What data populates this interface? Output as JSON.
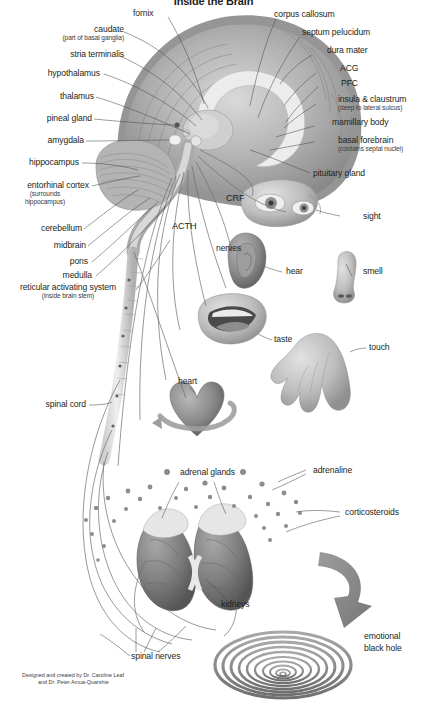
{
  "title": "Inside the Brain",
  "credit": {
    "line1": "Designed and created by Dr. Caroline Leaf",
    "line2": "and Dr. Peter Amua-Quarshie"
  },
  "colors": {
    "background": "#ffffff",
    "text": "#231f20",
    "leader_line": "#4b4b4b",
    "anatomy_mid": "#9a9a9a",
    "anatomy_dark": "#5e5e5e",
    "anatomy_light": "#d4d4d4",
    "arrow": "#8c8c8c",
    "spiral": "#8f8f8f",
    "kidney": "#7d7d7d",
    "heart": "#6f6f6f"
  },
  "brain_labels_left": [
    {
      "id": "fornix",
      "label": "fornix",
      "sub": ""
    },
    {
      "id": "caudate",
      "label": "caudate",
      "sub": "(part of basal ganglia)"
    },
    {
      "id": "stria-terminalis",
      "label": "stria terminalis",
      "sub": ""
    },
    {
      "id": "hypothalamus",
      "label": "hypothalamus",
      "sub": ""
    },
    {
      "id": "thalamus",
      "label": "thalamus",
      "sub": ""
    },
    {
      "id": "pineal-gland",
      "label": "pineal gland",
      "sub": ""
    },
    {
      "id": "amygdala",
      "label": "amygdala",
      "sub": ""
    },
    {
      "id": "hippocampus",
      "label": "hippocampus",
      "sub": ""
    },
    {
      "id": "entorhinal-cortex",
      "label": "entorhinal cortex",
      "sub": "(surrounds hippocampus)"
    },
    {
      "id": "cerebellum",
      "label": "cerebellum",
      "sub": ""
    },
    {
      "id": "midbrain",
      "label": "midbrain",
      "sub": ""
    },
    {
      "id": "pons",
      "label": "pons",
      "sub": ""
    },
    {
      "id": "medulla",
      "label": "medulla",
      "sub": ""
    },
    {
      "id": "reticular-activating-system",
      "label": "reticular activating system",
      "sub": "(inside brain stem)"
    }
  ],
  "brain_labels_right": [
    {
      "id": "corpus-callosum",
      "label": "corpus callosum",
      "sub": ""
    },
    {
      "id": "septum-pelucidum",
      "label": "septum pelucidum",
      "sub": ""
    },
    {
      "id": "dura-mater",
      "label": "dura mater",
      "sub": ""
    },
    {
      "id": "acg",
      "label": "ACG",
      "sub": ""
    },
    {
      "id": "pfc",
      "label": "PFC",
      "sub": ""
    },
    {
      "id": "insula-claustrum",
      "label": "insula & claustrum",
      "sub": "(deep to lateral sulcus)"
    },
    {
      "id": "mamillary-body",
      "label": "mamillary body",
      "sub": ""
    },
    {
      "id": "basal-forebrain",
      "label": "basal forebrain",
      "sub": "(contains septal nuclei)"
    },
    {
      "id": "pituitary-gland",
      "label": "pituitary gland",
      "sub": ""
    }
  ],
  "hormone_labels": [
    {
      "id": "crf",
      "label": "CRF"
    },
    {
      "id": "acth",
      "label": "ACTH"
    },
    {
      "id": "nerves",
      "label": "nerves"
    }
  ],
  "senses": [
    {
      "id": "sight",
      "label": "sight"
    },
    {
      "id": "hear",
      "label": "hear"
    },
    {
      "id": "smell",
      "label": "smell"
    },
    {
      "id": "taste",
      "label": "taste"
    },
    {
      "id": "touch",
      "label": "touch"
    }
  ],
  "organs": [
    {
      "id": "heart",
      "label": "heart"
    },
    {
      "id": "spinal-cord",
      "label": "spinal cord"
    },
    {
      "id": "adrenal-glands",
      "label": "adrenal glands"
    },
    {
      "id": "kidneys",
      "label": "kidneys"
    },
    {
      "id": "spinal-nerves",
      "label": "spinal nerves"
    }
  ],
  "hormones_released": [
    {
      "id": "adrenaline",
      "label": "adrenaline"
    },
    {
      "id": "corticosteroids",
      "label": "corticosteroids"
    }
  ],
  "emotional_black_hole": {
    "line1": "emotional",
    "line2": "black hole"
  }
}
